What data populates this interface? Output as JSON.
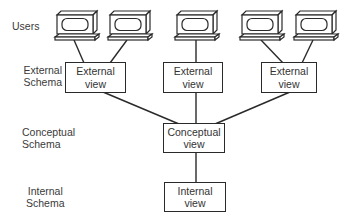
{
  "diagram": {
    "type": "three-schema architecture",
    "levels": {
      "users": {
        "label": "Users"
      },
      "external": {
        "label_line1": "External",
        "label_line2": "Schema"
      },
      "conceptual": {
        "label_line1": "Conceptual",
        "label_line2": "Schema"
      },
      "internal": {
        "label_line1": "Internal",
        "label_line2": "Schema"
      }
    },
    "nodes": {
      "external_views": [
        {
          "line1": "External",
          "line2": "view",
          "users": 2
        },
        {
          "line1": "External",
          "line2": "view",
          "users": 1
        },
        {
          "line1": "External",
          "line2": "view",
          "users": 2
        }
      ],
      "conceptual_view": {
        "line1": "Conceptual",
        "line2": "view"
      },
      "internal_view": {
        "line1": "Internal",
        "line2": "view"
      }
    },
    "user_terminals": [
      {
        "icon": "computer-terminal-icon",
        "connects_to": "external_view_1"
      },
      {
        "icon": "computer-terminal-icon",
        "connects_to": "external_view_1"
      },
      {
        "icon": "computer-terminal-icon",
        "connects_to": "external_view_2"
      },
      {
        "icon": "computer-terminal-icon",
        "connects_to": "external_view_3"
      },
      {
        "icon": "computer-terminal-icon",
        "connects_to": "external_view_3"
      }
    ],
    "colors": {
      "stroke": "#2a2a2a",
      "text": "#333333",
      "background": "#ffffff"
    }
  }
}
